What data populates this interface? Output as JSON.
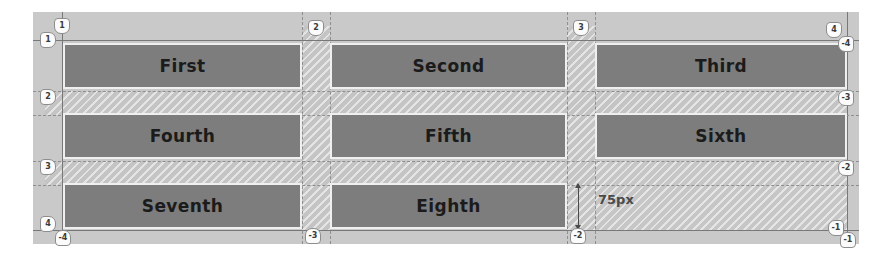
{
  "overlay": {
    "tool": "css-grid-inspector",
    "colors": {
      "grid_item_fill": "#7d7d7d",
      "grid_item_border": "#efefef",
      "gap_hatch": "#c4c4c4",
      "backdrop": "#c9c9c9",
      "grid_line": "#8e8e8e",
      "badge_bg": "#fbfbfb",
      "badge_text": "#3a3a3a",
      "annotation": "#4a4a4a"
    },
    "grid": {
      "columns": 3,
      "rows": 3,
      "column_line_numbers": [
        "1",
        "2",
        "3",
        "4"
      ],
      "row_line_numbers": [
        "1",
        "2",
        "3",
        "4"
      ],
      "column_line_numbers_negative": [
        "-4",
        "-3",
        "-2",
        "-1"
      ],
      "row_line_numbers_negative": [
        "-4",
        "-3",
        "-2",
        "-1"
      ]
    }
  },
  "items": [
    {
      "label": "First",
      "row": 1,
      "col": 1
    },
    {
      "label": "Second",
      "row": 1,
      "col": 2
    },
    {
      "label": "Third",
      "row": 1,
      "col": 3
    },
    {
      "label": "Fourth",
      "row": 2,
      "col": 1
    },
    {
      "label": "Fifth",
      "row": 2,
      "col": 2
    },
    {
      "label": "Sixth",
      "row": 2,
      "col": 3
    },
    {
      "label": "Seventh",
      "row": 3,
      "col": 1
    },
    {
      "label": "Eighth",
      "row": 3,
      "col": 2
    }
  ],
  "badges": {
    "top": [
      {
        "id": "col-line-1-top",
        "value": "1",
        "dir": "down",
        "x": 62,
        "y": 18
      },
      {
        "id": "col-line-2-top",
        "value": "2",
        "dir": "down",
        "x": 308,
        "y": 18
      },
      {
        "id": "col-line-3-top",
        "value": "3",
        "dir": "down",
        "x": 573,
        "y": 18
      },
      {
        "id": "col-line-4-top",
        "value": "4",
        "dir": "down",
        "x": 826,
        "y": 18
      }
    ],
    "left": [
      {
        "id": "row-line-1-left",
        "value": "1",
        "dir": "right",
        "x": 42,
        "y": 32
      },
      {
        "id": "row-line-2-left",
        "value": "2",
        "dir": "right",
        "x": 42,
        "y": 90
      },
      {
        "id": "row-line-3-left",
        "value": "3",
        "dir": "right",
        "x": 42,
        "y": 160
      },
      {
        "id": "row-line-4-left",
        "value": "4",
        "dir": "right",
        "x": 42,
        "y": 218
      }
    ],
    "right": [
      {
        "id": "row-line-neg4-right",
        "value": "-4",
        "dir": "left",
        "x": 838,
        "y": 38
      },
      {
        "id": "row-line-neg3-right",
        "value": "-3",
        "dir": "left",
        "x": 838,
        "y": 92
      },
      {
        "id": "row-line-neg2-right",
        "value": "-2",
        "dir": "left",
        "x": 838,
        "y": 162
      },
      {
        "id": "row-line-neg1-right",
        "value": "-1",
        "dir": "left",
        "x": 838,
        "y": 218
      }
    ],
    "bottom": [
      {
        "id": "col-line-neg4-bottom",
        "value": "-4",
        "dir": "up",
        "x": 55,
        "y": 228
      },
      {
        "id": "col-line-neg3-bottom",
        "value": "-3",
        "dir": "up",
        "x": 305,
        "y": 228
      },
      {
        "id": "col-line-neg2-bottom",
        "value": "-2",
        "dir": "up",
        "x": 570,
        "y": 228
      },
      {
        "id": "col-line-neg1-bottom",
        "value": "-1",
        "dir": "up",
        "x": 832,
        "y": 230
      }
    ]
  },
  "annotation": {
    "gap_measurement_label": "75px"
  }
}
